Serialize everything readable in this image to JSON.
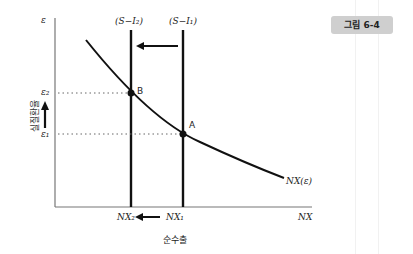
{
  "figure": {
    "badge": "그림 6-4",
    "y_axis_symbol": "ε",
    "x_axis_symbol": "NX",
    "y_axis_title": "실질환율",
    "x_axis_title": "순수출",
    "supply_lines": [
      {
        "label": "(S−I₂)",
        "x_px": 131
      },
      {
        "label": "(S−I₁)",
        "x_px": 183
      }
    ],
    "curve_label": "NX(ε)",
    "points": [
      {
        "name": "B",
        "x_label": "NX₂",
        "y_label": "ε₂"
      },
      {
        "name": "A",
        "x_label": "NX₁",
        "y_label": "ε₁"
      }
    ],
    "colors": {
      "line": "#111111",
      "axis": "#555555",
      "badge_bg": "#cfcfcf"
    }
  }
}
